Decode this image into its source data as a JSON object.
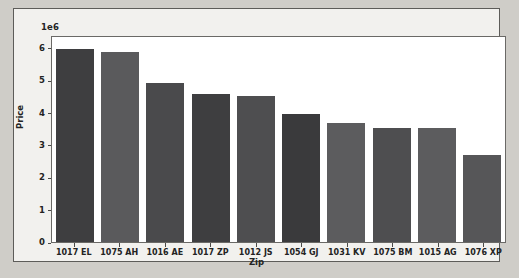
{
  "chart_data": {
    "type": "bar",
    "title": "",
    "xlabel": "Zip",
    "ylabel": "Price",
    "offset_text": "1e6",
    "categories": [
      "1017 EL",
      "1075 AH",
      "1016 AE",
      "1017 ZP",
      "1012 JS",
      "1054 GJ",
      "1031 KV",
      "1075 BM",
      "1015 AG",
      "1076 XP"
    ],
    "values": [
      5970000,
      5880000,
      4930000,
      4570000,
      4520000,
      3950000,
      3670000,
      3520000,
      3510000,
      2700000
    ],
    "ylim": [
      0,
      6400000
    ],
    "yticks": [
      0,
      1000000,
      2000000,
      3000000,
      4000000,
      5000000,
      6000000
    ],
    "ytick_labels": [
      "0",
      "1",
      "2",
      "3",
      "4",
      "5",
      "6"
    ],
    "grid": false,
    "legend": null,
    "bar_colors": [
      "#3e3e40",
      "#5a5a5c",
      "#4a4a4c",
      "#3e3e40",
      "#4e4e50",
      "#3a3a3c",
      "#5c5c5e",
      "#4e4e50",
      "#5c5c5e",
      "#565658"
    ],
    "plot_background": "#ffffff",
    "figure_background": "#f2f1ee"
  }
}
